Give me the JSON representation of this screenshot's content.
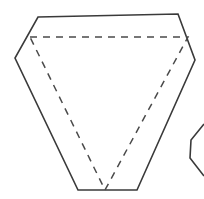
{
  "canvas": {
    "width": 204,
    "height": 199,
    "background": "#ffffff"
  },
  "style": {
    "solid_stroke": "#3a3a3a",
    "dashed_stroke": "#4a4a4a",
    "solid_width": 1.6,
    "dashed_width": 1.5,
    "dash_pattern": "7 6",
    "fill": "none"
  },
  "figure": {
    "main_shape": {
      "name": "hexagon-outline",
      "type": "polygon",
      "closed": true,
      "stroke_style": "solid",
      "points": "38,17 178,14 195,60 137,190 78,190 15,58"
    },
    "hidden_triangle": {
      "name": "inner-dashed-triangle",
      "type": "polyline",
      "closed": true,
      "stroke_style": "dashed",
      "points": "30,37 188,37 105,190"
    },
    "partial_shape": {
      "name": "partial-hexagon-right",
      "type": "polyline",
      "closed": false,
      "stroke_style": "solid",
      "points": "204,124 191,140 190,158 204,176"
    }
  }
}
